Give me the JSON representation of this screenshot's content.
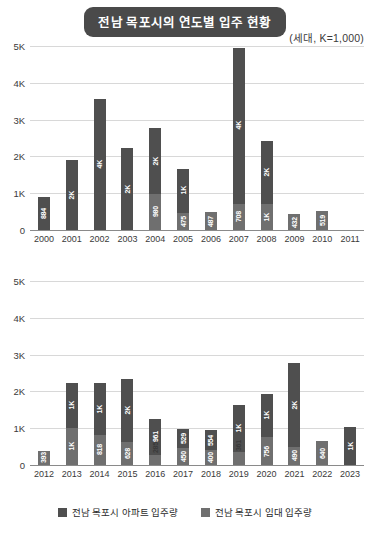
{
  "header": {
    "title": "전남 목포시의 연도별 입주 현황",
    "unit_caption": "(세대, K=1,000)"
  },
  "legend": {
    "items": [
      {
        "label": "전남 목포시 아파트 입주량",
        "color": "#4f4f4f",
        "key": "apartment"
      },
      {
        "label": "전남 목포시 임대 입주량",
        "color": "#6f6f6f",
        "key": "rental"
      }
    ]
  },
  "axis": {
    "ticks": [
      "5K",
      "4K",
      "3K",
      "2K",
      "1K",
      "0"
    ],
    "tick_values": [
      5000,
      4000,
      3000,
      2000,
      1000,
      0
    ],
    "ymax": 5000,
    "ymin": 0
  },
  "colors": {
    "title_pill_bg": "#4a4a4a",
    "title_pill_text": "#ffffff",
    "apartment": "#4f4f4f",
    "rental": "#6f6f6f",
    "gridline": "#d8d8d8",
    "axis": "#8a8a8a",
    "text": "#2b2b2b"
  },
  "chart_data": [
    {
      "type": "bar",
      "id": "chart-top",
      "title": "전남 목포시의 연도별 입주 현황",
      "subtitle": "(세대, K=1,000)",
      "stacked": true,
      "xlabel": "",
      "ylabel": "세대",
      "ylim": [
        0,
        5000
      ],
      "yticks": [
        0,
        1000,
        2000,
        3000,
        4000,
        5000
      ],
      "ytick_labels": [
        "0",
        "1K",
        "2K",
        "3K",
        "4K",
        "5K"
      ],
      "grid": true,
      "legend_position": "bottom",
      "categories": [
        "2000",
        "2001",
        "2002",
        "2003",
        "2004",
        "2005",
        "2006",
        "2007",
        "2008",
        "2009",
        "2010",
        "2011"
      ],
      "series": [
        {
          "name": "전남 목포시 아파트 입주량",
          "key": "apartment",
          "values": [
            884,
            1900,
            3570,
            2240,
            1780,
            1190,
            0,
            4250,
            1720,
            0,
            0,
            0
          ],
          "labels": [
            "884",
            "2K",
            "4K",
            "2K",
            "2K",
            "1K",
            "",
            "4K",
            "2K",
            "",
            "",
            ""
          ]
        },
        {
          "name": "전남 목포시 임대 입주량",
          "key": "rental",
          "values": [
            0,
            0,
            0,
            0,
            980,
            475,
            487,
            708,
            700,
            432,
            519,
            0
          ],
          "labels": [
            "",
            "",
            "",
            "",
            "980",
            "475",
            "487",
            "708",
            "1K",
            "432",
            "519",
            ""
          ]
        }
      ],
      "totals": [
        884,
        1900,
        3570,
        2240,
        2760,
        1665,
        487,
        4958,
        2420,
        432,
        519,
        0
      ]
    },
    {
      "type": "bar",
      "id": "chart-bottom",
      "title": "",
      "stacked": true,
      "xlabel": "",
      "ylabel": "세대",
      "ylim": [
        0,
        5000
      ],
      "yticks": [
        0,
        1000,
        2000,
        3000,
        4000,
        5000
      ],
      "ytick_labels": [
        "0",
        "1K",
        "2K",
        "3K",
        "4K",
        "5K"
      ],
      "grid": true,
      "legend_position": "bottom",
      "categories": [
        "2012",
        "2013",
        "2014",
        "2015",
        "2016",
        "2017",
        "2018",
        "2019",
        "2020",
        "2021",
        "2022",
        "2023"
      ],
      "series": [
        {
          "name": "전남 목포시 아파트 입주량",
          "key": "apartment",
          "values": [
            0,
            1230,
            1400,
            1720,
            961,
            529,
            554,
            1260,
            1180,
            2290,
            0,
            1030
          ],
          "labels": [
            "",
            "1K",
            "1K",
            "2K",
            "961",
            "529",
            "554",
            "1K",
            "1K",
            "2K",
            "",
            "1K"
          ]
        },
        {
          "name": "전남 목포시 임대 입주량",
          "key": "rental",
          "values": [
            393,
            1010,
            818,
            628,
            285,
            450,
            400,
            361,
            756,
            490,
            640,
            0
          ],
          "labels": [
            "393",
            "1K",
            "818",
            "628",
            "285",
            "450",
            "400",
            "361",
            "756",
            "490",
            "640",
            ""
          ]
        }
      ],
      "totals": [
        393,
        2240,
        2218,
        2348,
        1246,
        979,
        954,
        1621,
        1936,
        2780,
        640,
        1030
      ]
    }
  ]
}
